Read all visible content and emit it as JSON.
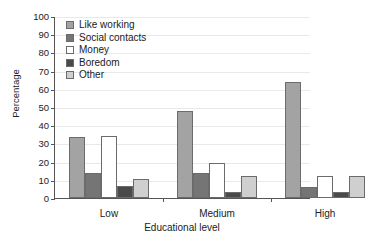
{
  "chart_data": {
    "type": "bar",
    "title": "",
    "subtitle": "",
    "xlabel": "Educational level",
    "ylabel": "Percentage",
    "categories": [
      "Low",
      "Medium",
      "High"
    ],
    "series": [
      {
        "name": "Like working",
        "values": [
          33.5,
          48.0,
          64.0
        ],
        "color": "#a3a3a3"
      },
      {
        "name": "Social contacts",
        "values": [
          13.5,
          13.5,
          6.0
        ],
        "color": "#757575"
      },
      {
        "name": "Money",
        "values": [
          34.0,
          19.5,
          12.0
        ],
        "color": "#ffffff"
      },
      {
        "name": "Boredom",
        "values": [
          6.5,
          3.5,
          3.5
        ],
        "color": "#4a4a4a"
      },
      {
        "name": "Other",
        "values": [
          10.5,
          12.0,
          12.0
        ],
        "color": "#cfcfcf"
      }
    ],
    "ylim": [
      0,
      100
    ],
    "yticks": [
      0,
      10,
      20,
      30,
      40,
      50,
      60,
      70,
      80,
      90,
      100
    ],
    "ytick_labels": [
      "0",
      "10",
      "20",
      "30",
      "40",
      "50",
      "60",
      "70",
      "80",
      "90",
      "100"
    ],
    "grid": true,
    "grid_axis": "y",
    "legend_position": "upper-left-inside",
    "legend_entries": [
      "Like working",
      "Social contacts",
      "Money",
      "Boredom",
      "Other"
    ],
    "bar_edge_color": "#6b6b6b",
    "axis_color": "#555555",
    "grid_color": "#e9e9e9",
    "background": "#ffffff"
  }
}
